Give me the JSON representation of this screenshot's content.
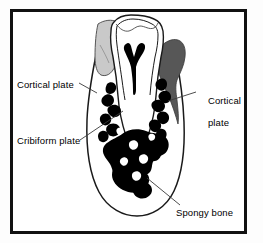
{
  "figure": {
    "frame_color": "#000000",
    "background_color": "#fdfdfd"
  },
  "labels": [
    {
      "id": "cortical-plate-left",
      "text": "Cortical plate",
      "position": "left-upper",
      "leader_target": "buccal cortical plate outline"
    },
    {
      "id": "cribiform-plate",
      "text": "Cribiform plate",
      "position": "left-lower",
      "leader_target": "lamina dura along root socket"
    },
    {
      "id": "cortical-plate-right",
      "text": "Cortical\nplate",
      "line1": "Cortical",
      "line2": "plate",
      "position": "right-upper",
      "leader_target": "lingual cortical plate"
    },
    {
      "id": "spongy-bone",
      "text": "Spongy bone",
      "position": "right-lower",
      "leader_target": "trabecular bone mass"
    }
  ],
  "anatomy": {
    "tooth": {
      "name": "molar-tooth",
      "enamel_fill": "#ffffff",
      "outline_color": "#1a1a1a",
      "pulp_chamber": {
        "name": "pulp-chamber",
        "fill": "#000000",
        "shape": "Y-shaped"
      }
    },
    "adjacent_tooth_left": {
      "name": "adjacent-tooth-left",
      "fill": "#c9c9c9"
    },
    "gingiva_right": {
      "name": "gingiva-right",
      "fill": "#575757"
    },
    "spongy_bone": {
      "name": "spongy-bone-trabeculae",
      "fill": "#000000"
    },
    "jaw_body": {
      "name": "jaw-body",
      "fill": "#ffffff",
      "outline_color": "#1a1a1a"
    }
  },
  "colors": {
    "black": "#000000",
    "outline": "#1a1a1a",
    "light_gray": "#c9c9c9",
    "dark_gray": "#575757",
    "leader_line": "#3a3a3a",
    "white": "#ffffff"
  }
}
